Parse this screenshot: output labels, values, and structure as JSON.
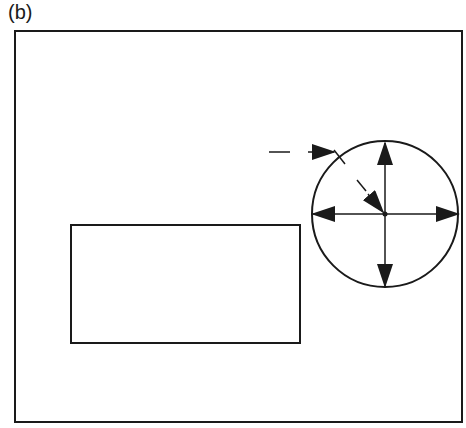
{
  "figure": {
    "panel_label": "(b)",
    "colors": {
      "stroke": "#1a1a1a",
      "background": "#ffffff"
    },
    "frame": {
      "x": 15,
      "y": 31,
      "width": 447,
      "height": 391
    },
    "rectangle": {
      "x": 71,
      "y": 225,
      "width": 229,
      "height": 118
    },
    "circle": {
      "cx": 385,
      "cy": 214,
      "r": 73
    },
    "arrows": [
      {
        "name": "up",
        "from": [
          385,
          214
        ],
        "to": [
          385,
          142
        ]
      },
      {
        "name": "down",
        "from": [
          385,
          214
        ],
        "to": [
          385,
          286
        ]
      },
      {
        "name": "left",
        "from": [
          385,
          214
        ],
        "to": [
          313,
          214
        ]
      },
      {
        "name": "right",
        "from": [
          385,
          214
        ],
        "to": [
          458,
          214
        ]
      },
      {
        "name": "diagonal-dashed",
        "from": [
          336,
          160
        ],
        "to": [
          382,
          210
        ]
      },
      {
        "name": "horizontal-dashed",
        "from": [
          269,
          152
        ],
        "to": [
          334,
          152
        ]
      }
    ]
  }
}
